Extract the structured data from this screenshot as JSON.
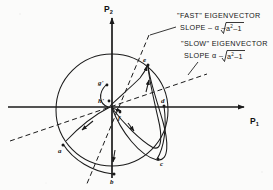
{
  "figure": {
    "type": "phase-plane-eigenvector-diagram",
    "background_color": "#fbfbfa",
    "ink_color": "#1a1a1a"
  },
  "axes": {
    "x_label": "P",
    "x_sub": "1",
    "y_label": "P",
    "y_sub": "2",
    "origin": {
      "x": 112,
      "y": 107
    },
    "x_axis_from_x": 8,
    "x_axis_to_x": 248,
    "y_axis_from_y": 178,
    "y_axis_to_y": 14
  },
  "annotations": [
    {
      "id": "fast-eigenvector",
      "line1": "\"FAST\" EIGENVECTOR",
      "line2_prefix": "SLOPE – α –",
      "radicand": "a",
      "radicand_exp": "2",
      "radicand_tail": "–1",
      "leader_from": {
        "x": 177,
        "y": 26
      },
      "leader_to": {
        "x": 152,
        "y": 34
      }
    },
    {
      "id": "slow-eigenvector",
      "line1": "\"SLOW\" EIGENVECTOR",
      "line2_prefix": "SLOPE   α –",
      "radicand": "a",
      "radicand_exp": "2",
      "radicand_tail": "–1",
      "leader_from": {
        "x": 197,
        "y": 58
      },
      "leader_to": {
        "x": 186,
        "y": 72
      }
    }
  ],
  "circle": {
    "cx": 112,
    "cy": 110,
    "r": 56,
    "stroke": "#1a1a1a"
  },
  "points": [
    {
      "label": "a",
      "x": 63,
      "y": 145,
      "tx": 60,
      "ty": 151
    },
    {
      "label": "b",
      "x": 114,
      "y": 174,
      "tx": 111,
      "ty": 182
    },
    {
      "label": "c",
      "x": 158,
      "y": 159,
      "tx": 160,
      "ty": 164
    },
    {
      "label": "d",
      "x": 163,
      "y": 106,
      "tx": 162,
      "ty": 103
    },
    {
      "label": "e",
      "x": 149,
      "y": 65,
      "tx": 145,
      "ty": 63
    },
    {
      "label": "f",
      "x": 120,
      "y": 112,
      "tx": 119,
      "ty": 118
    },
    {
      "label": "g'",
      "x": 106,
      "y": 84,
      "tx": 100,
      "ty": 84
    },
    {
      "label": "h'",
      "x": 107,
      "y": 100,
      "tx": 100,
      "ty": 101
    }
  ],
  "dashed_lines": [
    {
      "id": "fast-asymptote",
      "x1": 148,
      "y1": 36,
      "x2": 88,
      "y2": 185
    },
    {
      "id": "slow-asymptote",
      "x1": 12,
      "y1": 140,
      "x2": 205,
      "y2": 75
    }
  ],
  "curves": [
    {
      "id": "outer-loop"
    },
    {
      "id": "inner-loop"
    },
    {
      "id": "left-arc"
    },
    {
      "id": "lower-arc"
    },
    {
      "id": "small-arc-gh"
    }
  ]
}
